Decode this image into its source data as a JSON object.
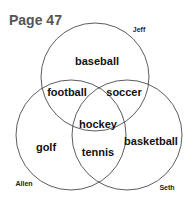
{
  "title": "Page 47",
  "circles": [
    {
      "name": "Jeff",
      "cx": 95,
      "cy": 77,
      "r": 54
    },
    {
      "name": "Allen",
      "cx": 71,
      "cy": 135,
      "r": 55
    },
    {
      "name": "Seth",
      "cx": 127,
      "cy": 135,
      "r": 55
    }
  ],
  "regions": {
    "jeff_only": "baseball",
    "jeff_allen": "football",
    "jeff_seth": "soccer",
    "all_three": "hockey",
    "allen_only": "golf",
    "allen_seth": "tennis",
    "seth_only": "basketball"
  },
  "names": {
    "jeff": "Jeff",
    "allen": "Allen",
    "seth": "Seth"
  }
}
